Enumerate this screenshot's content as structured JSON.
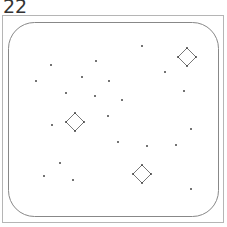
{
  "label": "22",
  "colors": {
    "frame": "#b5b5b5",
    "field": "#888888",
    "dot": "#444444",
    "diamond": "#777777"
  },
  "dots": [
    {
      "x": 142,
      "y": 46
    },
    {
      "x": 51,
      "y": 65
    },
    {
      "x": 96,
      "y": 61
    },
    {
      "x": 165,
      "y": 72
    },
    {
      "x": 36,
      "y": 81
    },
    {
      "x": 82,
      "y": 77
    },
    {
      "x": 109,
      "y": 81
    },
    {
      "x": 184,
      "y": 91
    },
    {
      "x": 66,
      "y": 93
    },
    {
      "x": 95,
      "y": 96
    },
    {
      "x": 122,
      "y": 100
    },
    {
      "x": 108,
      "y": 116
    },
    {
      "x": 52,
      "y": 125
    },
    {
      "x": 191,
      "y": 129
    },
    {
      "x": 118,
      "y": 142
    },
    {
      "x": 147,
      "y": 146
    },
    {
      "x": 176,
      "y": 145
    },
    {
      "x": 60,
      "y": 163
    },
    {
      "x": 44,
      "y": 176
    },
    {
      "x": 73,
      "y": 180
    },
    {
      "x": 191,
      "y": 189
    }
  ],
  "diamonds": [
    {
      "cx": 187,
      "cy": 57
    },
    {
      "cx": 75,
      "cy": 122
    },
    {
      "cx": 142,
      "cy": 174
    }
  ]
}
